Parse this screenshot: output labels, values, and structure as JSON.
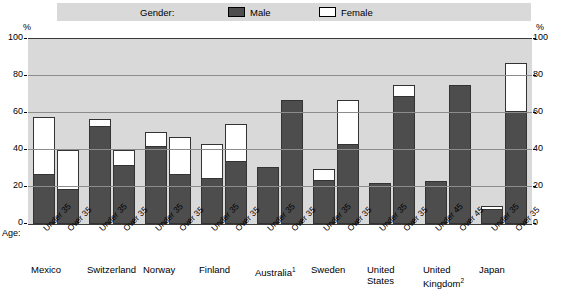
{
  "legend": {
    "title": "Gender:",
    "items": [
      {
        "label": "Male",
        "swatch": "filled-dark-square",
        "color": "#4d4d4d"
      },
      {
        "label": "Female",
        "swatch": "outlined-white-square",
        "color": "#ffffff"
      }
    ]
  },
  "axis": {
    "unit_left": "%",
    "unit_right": "%",
    "age_label": "Age:",
    "ticks": [
      "100",
      "80",
      "60",
      "40",
      "20",
      "0"
    ]
  },
  "chart_data": {
    "type": "bar",
    "title": "",
    "subtitle": "",
    "xlabel": "Age:",
    "ylabel": "%",
    "ylim": [
      0,
      100
    ],
    "yticks": [
      0,
      20,
      40,
      60,
      80,
      100
    ],
    "grid": true,
    "legend_position": "top",
    "stacked": true,
    "legend": [
      "Male",
      "Female"
    ],
    "colors": {
      "male": "#4d4d4d",
      "female": "#ffffff",
      "plot_background": "#d9d9d9",
      "gridline": "#8c8c8c",
      "outline": "#333333"
    },
    "groups": [
      {
        "country": "Mexico",
        "footnote": "",
        "bars": [
          {
            "age": "Under 35",
            "male": 27,
            "female": 31,
            "total": 58
          },
          {
            "age": "Over 35",
            "male": 19,
            "female": 21,
            "total": 40
          }
        ]
      },
      {
        "country": "Switzerland",
        "footnote": "",
        "bars": [
          {
            "age": "Under 35",
            "male": 53,
            "female": 4,
            "total": 57
          },
          {
            "age": "Over 35",
            "male": 32,
            "female": 8,
            "total": 40
          }
        ]
      },
      {
        "country": "Norway",
        "footnote": "",
        "bars": [
          {
            "age": "Under 35",
            "male": 42,
            "female": 8,
            "total": 50
          },
          {
            "age": "Over 35",
            "male": 27,
            "female": 20,
            "total": 47
          }
        ]
      },
      {
        "country": "Finland",
        "footnote": "",
        "bars": [
          {
            "age": "Under 35",
            "male": 25,
            "female": 18,
            "total": 43
          },
          {
            "age": "Over 35",
            "male": 34,
            "female": 20,
            "total": 54
          }
        ]
      },
      {
        "country": "Australia",
        "footnote": "1",
        "bars": [
          {
            "age": "Under 35",
            "male": 31,
            "female": 0,
            "total": 31
          },
          {
            "age": "Over 35",
            "male": 67,
            "female": 0,
            "total": 67
          }
        ]
      },
      {
        "country": "Sweden",
        "footnote": "",
        "bars": [
          {
            "age": "Under 35",
            "male": 24,
            "female": 6,
            "total": 30
          },
          {
            "age": "Over 35",
            "male": 43,
            "female": 24,
            "total": 67
          }
        ]
      },
      {
        "country": "United States",
        "footnote": "",
        "bars": [
          {
            "age": "Under 35",
            "male": 22,
            "female": 0,
            "total": 22
          },
          {
            "age": "Over 35",
            "male": 69,
            "female": 6,
            "total": 75
          }
        ]
      },
      {
        "country": "United Kingdom",
        "footnote": "2",
        "bars": [
          {
            "age": "Under 45",
            "male": 23,
            "female": 0,
            "total": 23
          },
          {
            "age": "Over 45",
            "male": 75,
            "female": 0,
            "total": 75
          }
        ]
      },
      {
        "country": "Japan",
        "footnote": "",
        "bars": [
          {
            "age": "Under 35",
            "male": 8,
            "female": 2,
            "total": 10
          },
          {
            "age": "Over 35",
            "male": 61,
            "female": 26,
            "total": 87
          }
        ]
      }
    ]
  }
}
